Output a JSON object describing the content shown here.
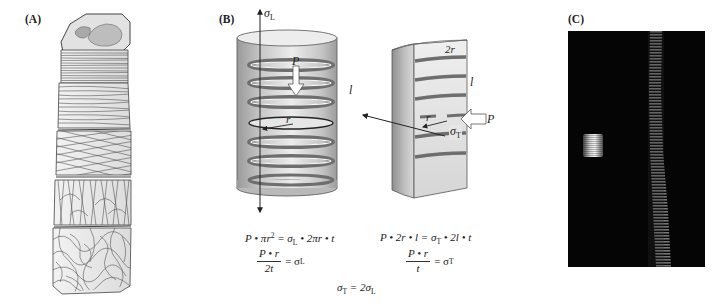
{
  "panels": {
    "a": {
      "label": "(A)",
      "description": "Layered fiber-wrapped stack showing circumferential, helical, crossed, longitudinal and random fiber orientations"
    },
    "b": {
      "label": "(B)",
      "left_cylinder": {
        "stress_label": "σ",
        "stress_sub": "L",
        "pressure_label": "P",
        "radius_label": "r",
        "length_label": "l"
      },
      "right_half_cylinder": {
        "diameter_label": "2r",
        "length_label": "l",
        "radius_label": "r",
        "pressure_label": "P",
        "stress_label": "σ",
        "stress_sub": "T"
      },
      "equations": {
        "left_line1": {
          "lhs": "P • πr",
          "lhs_sup": "2",
          "mid": " = σ",
          "mid_sub": "L",
          "rhs": " • 2πr • t"
        },
        "left_fraction": {
          "numerator": "P • r",
          "denominator": "2t",
          "result": "= σ",
          "result_sub": "L"
        },
        "right_line1": {
          "lhs": "P • 2r • l = σ",
          "lhs_sub": "T",
          "rhs": " • 2l • t"
        },
        "right_fraction": {
          "numerator": "P • r",
          "denominator": "t",
          "result": "= σ",
          "result_sub": "T"
        },
        "conclusion": {
          "a": "σ",
          "a_sub": "T",
          "mid": " = 2σ",
          "b_sub": "L"
        }
      }
    },
    "c": {
      "label": "(C)",
      "description": "Dark-field micrograph with bright striated blob and faint striated vertical band"
    }
  },
  "colors": {
    "background": "#ffffff",
    "cylinder_light": "#e6e6e6",
    "cylinder_dark": "#8c8c8c",
    "band": "#7a7a7a",
    "stroke": "#333333",
    "micrograph_bg": "#050505"
  }
}
